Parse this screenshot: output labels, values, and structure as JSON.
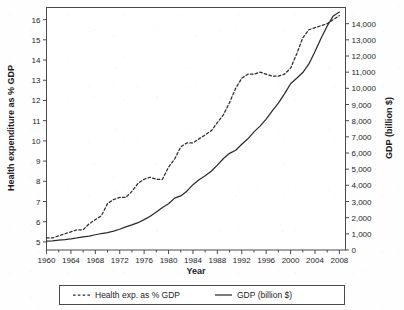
{
  "chart_data": {
    "type": "line",
    "title": "",
    "xlabel": "Year",
    "ylabel": "Health expenditure as % GDP",
    "y2label": "GDP (billion $)",
    "grid": false,
    "legend_position": "bottom",
    "xlim": [
      1960,
      2009
    ],
    "ylim": [
      4.6,
      16.6
    ],
    "y2lim": [
      0,
      15000
    ],
    "x_ticks": [
      1960,
      1964,
      1968,
      1972,
      1976,
      1980,
      1984,
      1988,
      1992,
      1996,
      2000,
      2004,
      2008
    ],
    "x_tick_labels": [
      "1960",
      "1964",
      "1968",
      "1972",
      "1976",
      "1980",
      "1984",
      "1988",
      "1992",
      "1996",
      "2000",
      "2004",
      "2008"
    ],
    "x_minor_ticks": [
      1962,
      1966,
      1970,
      1974,
      1978,
      1982,
      1986,
      1990,
      1994,
      1998,
      2002,
      2006
    ],
    "y_ticks": [
      5,
      6,
      7,
      8,
      9,
      10,
      11,
      12,
      13,
      14,
      15,
      16
    ],
    "y_tick_labels": [
      "5",
      "6",
      "7",
      "8",
      "9",
      "10",
      "11",
      "12",
      "13",
      "14",
      "15",
      "16"
    ],
    "y2_ticks": [
      0,
      1000,
      2000,
      3000,
      4000,
      5000,
      6000,
      7000,
      8000,
      9000,
      10000,
      11000,
      12000,
      13000,
      14000
    ],
    "y2_tick_labels": [
      "0",
      "1,000",
      "2,000",
      "3,000",
      "4,000",
      "5,000",
      "6,000",
      "7,000",
      "8,000",
      "9,000",
      "10,000",
      "11,000",
      "12,000",
      "13,000",
      "14,000"
    ],
    "x": [
      1960,
      1961,
      1962,
      1963,
      1964,
      1965,
      1966,
      1967,
      1968,
      1969,
      1970,
      1971,
      1972,
      1973,
      1974,
      1975,
      1976,
      1977,
      1978,
      1979,
      1980,
      1981,
      1982,
      1983,
      1984,
      1985,
      1986,
      1987,
      1988,
      1989,
      1990,
      1991,
      1992,
      1993,
      1994,
      1995,
      1996,
      1997,
      1998,
      1999,
      2000,
      2001,
      2002,
      2003,
      2004,
      2005,
      2006,
      2007,
      2008
    ],
    "series": [
      {
        "name": "Health exp. as % GDP",
        "axis": "left",
        "style": "dashed",
        "color": "#2b2b2b",
        "values": [
          5.2,
          5.2,
          5.3,
          5.4,
          5.5,
          5.6,
          5.6,
          5.9,
          6.1,
          6.3,
          6.9,
          7.1,
          7.2,
          7.2,
          7.5,
          7.9,
          8.1,
          8.2,
          8.1,
          8.1,
          8.7,
          9.1,
          9.7,
          9.9,
          9.9,
          10.1,
          10.3,
          10.5,
          10.9,
          11.3,
          11.9,
          12.6,
          13.1,
          13.3,
          13.3,
          13.4,
          13.3,
          13.2,
          13.2,
          13.3,
          13.6,
          14.3,
          15.1,
          15.5,
          15.6,
          15.7,
          15.8,
          16.0,
          16.2
        ]
      },
      {
        "name": "GDP (billion $)",
        "axis": "right",
        "style": "solid",
        "color": "#2b2b2b",
        "values": [
          543,
          563,
          605,
          639,
          686,
          744,
          815,
          862,
          943,
          1020,
          1076,
          1168,
          1282,
          1429,
          1549,
          1689,
          1878,
          2086,
          2357,
          2632,
          2863,
          3211,
          3345,
          3638,
          4041,
          4347,
          4590,
          4870,
          5253,
          5658,
          5980,
          6174,
          6539,
          6879,
          7309,
          7664,
          8100,
          8609,
          9089,
          9661,
          10285,
          10622,
          10978,
          11511,
          12275,
          13094,
          13856,
          14478,
          14719
        ]
      }
    ]
  },
  "legend": {
    "items": [
      {
        "label": "Health exp. as % GDP",
        "style": "dashed"
      },
      {
        "label": "GDP (billion $)",
        "style": "solid"
      }
    ]
  }
}
